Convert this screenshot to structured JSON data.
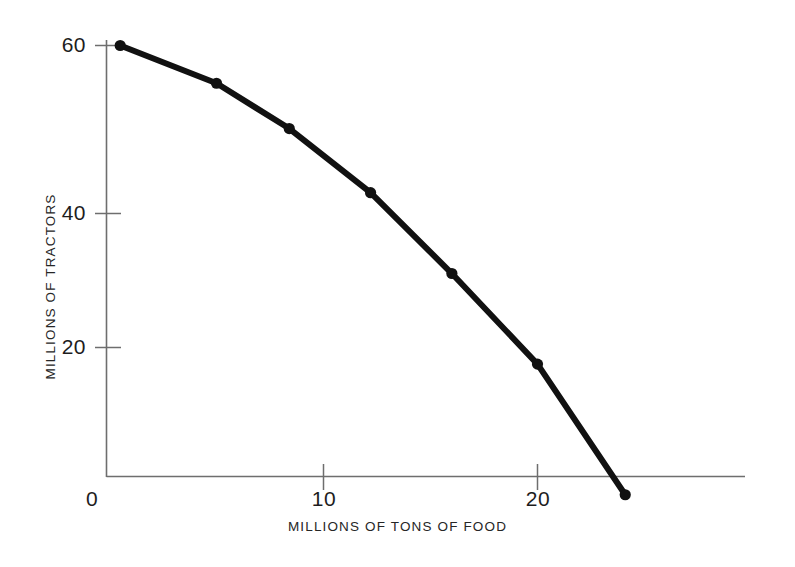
{
  "chart_data": {
    "type": "line",
    "title": "",
    "subtitle": "",
    "xlabel": "MILLIONS OF TONS OF FOOD",
    "ylabel": "MILLIONS OF TRACTORS",
    "xlim": [
      0,
      29.8
    ],
    "ylim": [
      0,
      63.5
    ],
    "xticks": [
      0,
      10,
      20
    ],
    "xticklabels": [
      "0",
      "10",
      "20"
    ],
    "yticks": [
      20,
      40,
      60
    ],
    "yticklabels": [
      "20",
      "40",
      "60"
    ],
    "grid": false,
    "legend": null,
    "legend_position": "none",
    "series": [
      {
        "name": "production possibilities frontier",
        "marker": "circle",
        "line_color": "#111111",
        "line_width": 6,
        "points": [
          {
            "x": 0.5,
            "y": 60.0
          },
          {
            "x": 5.0,
            "y": 55.0
          },
          {
            "x": 8.4,
            "y": 49.0
          },
          {
            "x": 12.2,
            "y": 40.5
          },
          {
            "x": 16.0,
            "y": 29.8
          },
          {
            "x": 20.0,
            "y": 17.8
          },
          {
            "x": 24.1,
            "y": 0.5
          }
        ],
        "x": [
          0.5,
          5.0,
          8.4,
          12.2,
          16.0,
          20.0,
          24.1
        ],
        "values": [
          60.0,
          55.0,
          49.0,
          40.5,
          29.8,
          17.8,
          0.5
        ]
      }
    ],
    "annotations": []
  },
  "axis_style": {
    "axis_color": "#6e6e6e",
    "tick_color": "#6e6e6e",
    "curve_color": "#111111",
    "background": "#ffffff"
  },
  "labels": {
    "x_title": "MILLIONS OF TONS OF FOOD",
    "y_title": "MILLIONS OF TRACTORS",
    "x_tick_0": "0",
    "x_tick_10": "10",
    "x_tick_20": "20",
    "y_tick_20": "20",
    "y_tick_40": "40",
    "y_tick_60": "60"
  }
}
